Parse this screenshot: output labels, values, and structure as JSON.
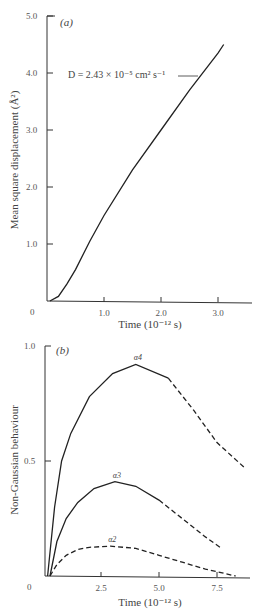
{
  "chart_data": [
    {
      "type": "line",
      "panel_label": "(a)",
      "title": "",
      "xlabel": "Time (10⁻¹² s)",
      "ylabel": "Mean square displacement (Å²)",
      "xlim": [
        0,
        3.5
      ],
      "ylim": [
        0,
        5.0
      ],
      "x_ticks": [
        "1.0",
        "2.0",
        "3.0"
      ],
      "y_ticks": [
        "1.0",
        "2.0",
        "3.0",
        "4.0",
        "5.0"
      ],
      "origin_label": "0",
      "grid": false,
      "annotation": "D = 2.43 × 10⁻⁵ cm² s⁻¹",
      "series": [
        {
          "name": "MSD",
          "style": "solid",
          "x": [
            0.05,
            0.2,
            0.35,
            0.5,
            0.75,
            1.0,
            1.5,
            2.0,
            2.5,
            3.0,
            3.1
          ],
          "y": [
            0.0,
            0.08,
            0.3,
            0.55,
            1.05,
            1.5,
            2.3,
            3.0,
            3.7,
            4.35,
            4.5
          ]
        }
      ]
    },
    {
      "type": "line",
      "panel_label": "(b)",
      "title": "",
      "xlabel": "Time (10⁻¹² s)",
      "ylabel": "Non-Gaussian behaviour",
      "xlim": [
        0,
        9
      ],
      "ylim": [
        0,
        1.0
      ],
      "x_ticks": [
        "2.5",
        "5.0",
        "7.5"
      ],
      "y_ticks": [
        "0.5",
        "1.0"
      ],
      "origin_label": "0",
      "grid": false,
      "series": [
        {
          "name": "α4",
          "style": "solid then dashed",
          "x": [
            0.2,
            0.5,
            0.8,
            1.2,
            2.0,
            3.0,
            4.0,
            5.4,
            6.5,
            7.5,
            8.7
          ],
          "y": [
            0.0,
            0.3,
            0.5,
            0.62,
            0.78,
            0.88,
            0.92,
            0.86,
            0.72,
            0.58,
            0.47
          ],
          "solid_until_x": 5.4
        },
        {
          "name": "α3",
          "style": "solid then dashed",
          "x": [
            0.3,
            0.6,
            1.0,
            1.5,
            2.2,
            3.1,
            4.0,
            5.0,
            6.0,
            7.0,
            7.7
          ],
          "y": [
            0.0,
            0.15,
            0.25,
            0.32,
            0.38,
            0.41,
            0.39,
            0.33,
            0.25,
            0.17,
            0.12
          ],
          "solid_until_x": 5.0
        },
        {
          "name": "α2",
          "style": "dashed",
          "x": [
            0.3,
            0.6,
            1.0,
            1.5,
            2.0,
            2.9,
            4.0,
            5.0,
            6.0,
            7.0,
            8.3
          ],
          "y": [
            0.0,
            0.05,
            0.09,
            0.115,
            0.125,
            0.13,
            0.12,
            0.09,
            0.06,
            0.03,
            0.0
          ],
          "solid_until_x": 0
        }
      ]
    }
  ]
}
